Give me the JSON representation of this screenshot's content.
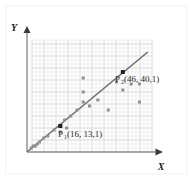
{
  "figure": {
    "name": "scatter-plot-with-regression-line",
    "background_color": "#ffffff",
    "card_edge_color": "#f2f2f2"
  },
  "axes": {
    "x_label": "X",
    "y_label": "Y",
    "axis_color": "#8c8c8c",
    "arrow_color": "#3a3a3a",
    "origin_px": {
      "x": 27,
      "y": 152
    },
    "x_end_px": {
      "x": 160,
      "y": 152
    },
    "y_end_px": {
      "x": 27,
      "y": 30
    }
  },
  "grid": {
    "show": true,
    "minor_spacing_px": 4,
    "major_every": 3,
    "minor_color": "#eceaea",
    "major_color": "#d8d6d6",
    "left_px": 32,
    "top_px": 40,
    "right_px": 152,
    "bottom_px": 152
  },
  "labels": [
    {
      "name": "label-p1",
      "base": "P",
      "subscript": "1",
      "value_text": "(16, 13,1)",
      "x_px": 58,
      "y_px": 137
    },
    {
      "name": "label-p2",
      "base": "P",
      "subscript": "2",
      "value_text": "(46, 40,1)",
      "x_px": 115,
      "y_px": 82
    }
  ],
  "chart_data": {
    "type": "scatter",
    "title": "",
    "xlabel": "X",
    "ylabel": "Y",
    "grid": true,
    "legend": null,
    "xlim": [
      0,
      60
    ],
    "ylim": [
      0,
      56
    ],
    "series": [
      {
        "name": "data-points",
        "marker": "square",
        "color": "#8f8f8f",
        "size_px": 3,
        "points": [
          {
            "x": 2,
            "y": 2
          },
          {
            "x": 3,
            "y": 3
          },
          {
            "x": 4,
            "y": 3
          },
          {
            "x": 5,
            "y": 4
          },
          {
            "x": 6,
            "y": 5
          },
          {
            "x": 8,
            "y": 7
          },
          {
            "x": 10,
            "y": 8
          },
          {
            "x": 13,
            "y": 11
          },
          {
            "x": 16,
            "y": 10
          },
          {
            "x": 18,
            "y": 16
          },
          {
            "x": 19,
            "y": 12
          },
          {
            "x": 21,
            "y": 18
          },
          {
            "x": 24,
            "y": 21
          },
          {
            "x": 27,
            "y": 37
          },
          {
            "x": 27,
            "y": 30
          },
          {
            "x": 27,
            "y": 25
          },
          {
            "x": 30,
            "y": 23
          },
          {
            "x": 34,
            "y": 26
          },
          {
            "x": 39,
            "y": 21
          },
          {
            "x": 43,
            "y": 35
          },
          {
            "x": 46,
            "y": 31
          },
          {
            "x": 50,
            "y": 34
          },
          {
            "x": 54,
            "y": 34
          },
          {
            "x": 54,
            "y": 25
          }
        ]
      },
      {
        "name": "highlighted-points",
        "marker": "square",
        "color": "#1f1f1f",
        "size_px": 4,
        "points": [
          {
            "x": 16,
            "y": 13,
            "label": "P1"
          },
          {
            "x": 46,
            "y": 40,
            "label": "P2"
          }
        ]
      }
    ],
    "fit_line": {
      "name": "regression-line",
      "color": "#6d6d6d",
      "width_px": 1.6,
      "from": {
        "x": 0,
        "y": 0
      },
      "to": {
        "x": 58,
        "y": 50
      }
    }
  }
}
